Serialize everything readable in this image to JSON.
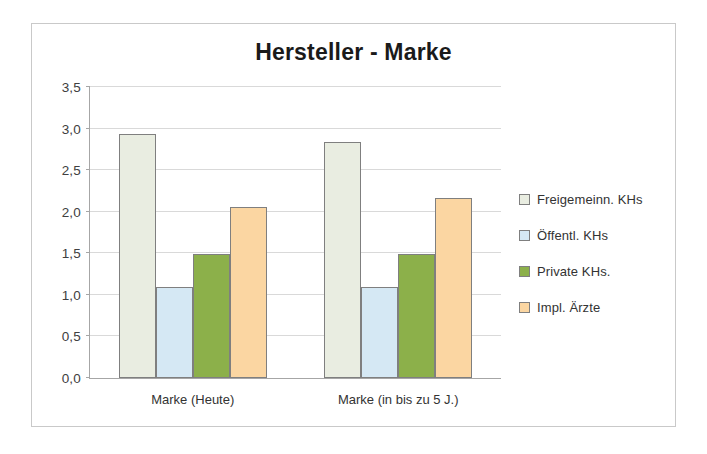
{
  "chart_data": {
    "type": "bar",
    "title": "Hersteller - Marke",
    "xlabel": "",
    "ylabel": "",
    "ylim": [
      0.0,
      3.5
    ],
    "ytick_labels": [
      "0,0",
      "0,5",
      "1,0",
      "1,5",
      "2,0",
      "2,5",
      "3,0",
      "3,5"
    ],
    "ytick_values": [
      0.0,
      0.5,
      1.0,
      1.5,
      2.0,
      2.5,
      3.0,
      3.5
    ],
    "grid": true,
    "legend_position": "right",
    "categories": [
      "Marke (Heute)",
      "Marke (in bis zu 5 J.)"
    ],
    "series": [
      {
        "name": "Freigemeinn. KHs",
        "color": "#e9ede1",
        "values": [
          2.93,
          2.84
        ]
      },
      {
        "name": "Öffentl. KHs",
        "color": "#d5e8f4",
        "values": [
          1.09,
          1.09
        ]
      },
      {
        "name": "Private KHs.",
        "color": "#8cb04a",
        "values": [
          1.49,
          1.49
        ]
      },
      {
        "name": "Impl. Ärzte",
        "color": "#fbd6a2",
        "values": [
          2.06,
          2.17
        ]
      }
    ]
  },
  "frame": {
    "border_color": "#c9c9c9",
    "axis_color": "#a6a6a6",
    "gridline_color": "#d9d9d9",
    "bar_border_color": "#7f7f7f"
  }
}
